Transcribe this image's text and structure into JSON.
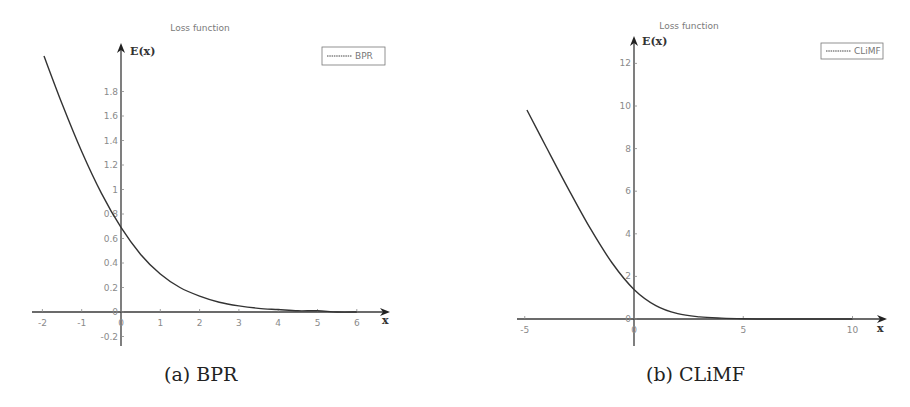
{
  "figure": {
    "captions": [
      "(a) BPR",
      "(b) CLiMF"
    ]
  },
  "chart_data": [
    {
      "type": "line",
      "title": "Loss function",
      "xlabel": "x",
      "ylabel": "E(x)",
      "legend": [
        "BPR"
      ],
      "legend_position": "upper right",
      "grid": false,
      "xlim": [
        -2,
        6
      ],
      "ylim": [
        -0.2,
        2.1
      ],
      "xticks": [
        -2,
        -1,
        0,
        1,
        2,
        3,
        4,
        5,
        6
      ],
      "yticks": [
        -0.2,
        0,
        0.2,
        0.4,
        0.6,
        0.8,
        1,
        1.2,
        1.4,
        1.6,
        1.8
      ],
      "ytick_labels": [
        "-0.2",
        "0",
        "0.2",
        "0.4",
        "0.6",
        "0.8",
        "1",
        "1.2",
        "1.4",
        "1.6",
        "1.8"
      ],
      "series": [
        {
          "name": "BPR",
          "x": [
            -1.96,
            -1.5,
            -1.0,
            -0.5,
            0.0,
            0.5,
            1.0,
            1.5,
            2.0,
            2.5,
            3.0,
            3.5,
            4.0,
            4.5,
            5.0,
            5.5,
            6.0
          ],
          "y": [
            2.09,
            1.7,
            1.31,
            0.97,
            0.69,
            0.47,
            0.31,
            0.2,
            0.13,
            0.08,
            0.05,
            0.03,
            0.02,
            0.01,
            0.01,
            0.0,
            0.0
          ]
        }
      ]
    },
    {
      "type": "line",
      "title": "Loss function",
      "xlabel": "x",
      "ylabel": "E(x)",
      "legend": [
        "CLiMF"
      ],
      "legend_position": "upper right",
      "grid": false,
      "xlim": [
        -5,
        11
      ],
      "ylim": [
        -1,
        13
      ],
      "xticks": [
        -5,
        0,
        5,
        10
      ],
      "yticks": [
        0,
        2,
        4,
        6,
        8,
        10,
        12
      ],
      "ytick_labels": [
        "0",
        "2",
        "4",
        "6",
        "8",
        "10",
        "12"
      ],
      "series": [
        {
          "name": "CLiMF",
          "x": [
            -4.9,
            -4,
            -3,
            -2,
            -1,
            0,
            1,
            2,
            3,
            4,
            5,
            6,
            7,
            8,
            9,
            10
          ],
          "y": [
            9.81,
            8.04,
            6.1,
            4.25,
            2.63,
            1.39,
            0.63,
            0.25,
            0.1,
            0.04,
            0.01,
            0.0,
            0.0,
            0.0,
            0.0,
            0.0
          ]
        }
      ]
    }
  ],
  "plot_layout": [
    {
      "origin_px": [
        121,
        312
      ],
      "px_per_x": 39.3,
      "px_per_y": 122.5,
      "x_axis_px": [
        32,
        390
      ],
      "y_axis_px": [
        43,
        346
      ],
      "title_px": [
        200,
        31
      ],
      "legend_box_px": [
        322,
        47,
        63,
        18
      ],
      "xlabel_px": [
        382,
        324
      ],
      "ylabel_px": [
        130,
        55
      ],
      "color": "#3a3a3a"
    },
    {
      "origin_px": [
        634,
        319
      ],
      "px_per_x": 21.85,
      "px_per_y": 21.3,
      "x_axis_px": [
        517,
        887
      ],
      "y_axis_px": [
        36,
        346
      ],
      "title_px": [
        689,
        29
      ],
      "legend_box_px": [
        821,
        43,
        62,
        16
      ],
      "xlabel_px": [
        877,
        332
      ],
      "ylabel_px": [
        642,
        45
      ],
      "color": "#3a3a3a"
    }
  ]
}
